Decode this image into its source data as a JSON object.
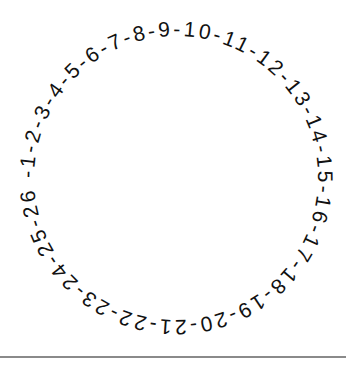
{
  "figure": {
    "circular_text": "-1-2-3-4-5-6-7-8-9-10-11-12-13-14-15-16-17-18-19-20-21-22-23-24-25-26",
    "numbers": [
      "1",
      "2",
      "3",
      "4",
      "5",
      "6",
      "7",
      "8",
      "9",
      "10",
      "11",
      "12",
      "13",
      "14",
      "15",
      "16",
      "17",
      "18",
      "19",
      "20",
      "21",
      "22",
      "23",
      "24",
      "25",
      "26"
    ],
    "separator": "-",
    "text_color": "#111111",
    "divider_color": "#8a8a8a"
  }
}
